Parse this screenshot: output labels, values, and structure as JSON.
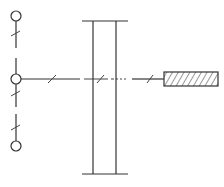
{
  "diagram": {
    "type": "schematic",
    "colors": {
      "stroke": "#333333",
      "background": "#ffffff",
      "hatch": "#333333"
    },
    "components": {
      "terminals": [
        "top-terminal",
        "middle-terminal",
        "bottom-terminal"
      ],
      "frame": "double-vertical-frame",
      "block": "hatched-block"
    },
    "labels": []
  }
}
